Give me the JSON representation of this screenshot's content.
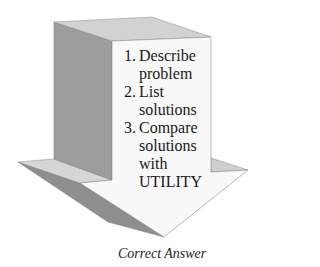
{
  "figure": {
    "type": "3d-down-arrow",
    "colors": {
      "front_face": "#f8f8f8",
      "top_face": "#d2d2d2",
      "side_face": "#9d9d9d",
      "wing_top": "#d6d6d6",
      "underside": "#8e8e8e",
      "edge": "#7a7a7a"
    },
    "steps": [
      {
        "number": "1.",
        "text": "Describe problem"
      },
      {
        "number": "2.",
        "text": "List solutions"
      },
      {
        "number": "3.",
        "text": "Compare solutions with UTILITY"
      }
    ]
  },
  "caption": "Correct Answer"
}
